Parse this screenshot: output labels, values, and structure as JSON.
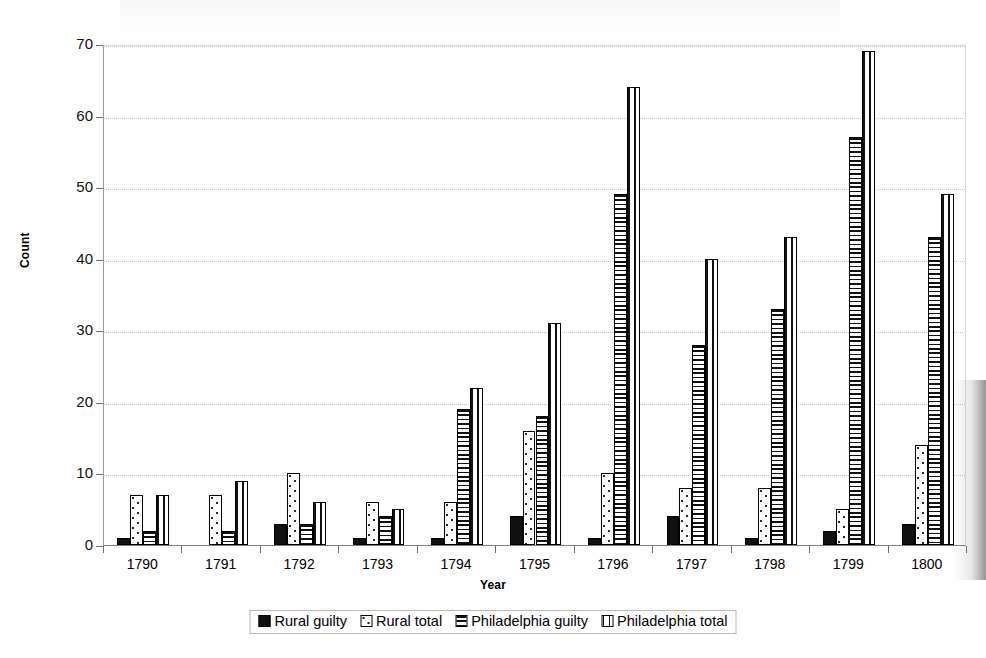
{
  "chart_data": {
    "type": "bar",
    "title": "",
    "xlabel": "Year",
    "ylabel": "Count",
    "ylim": [
      0,
      70
    ],
    "yticks": [
      0,
      10,
      20,
      30,
      40,
      50,
      60,
      70
    ],
    "grid": true,
    "legend_position": "bottom",
    "categories": [
      "1790",
      "1791",
      "1792",
      "1793",
      "1794",
      "1795",
      "1796",
      "1797",
      "1798",
      "1799",
      "1800"
    ],
    "series": [
      {
        "name": "Rural guilty",
        "pattern": "solid-black",
        "values": [
          1,
          0,
          3,
          1,
          1,
          4,
          1,
          4,
          1,
          2,
          3
        ]
      },
      {
        "name": "Rural total",
        "pattern": "dotted",
        "values": [
          7,
          7,
          10,
          6,
          6,
          16,
          10,
          8,
          8,
          5,
          14
        ]
      },
      {
        "name": "Philadelphia guilty",
        "pattern": "horizontal-lines",
        "values": [
          2,
          2,
          3,
          4,
          19,
          18,
          49,
          28,
          33,
          57,
          43
        ]
      },
      {
        "name": "Philadelphia total",
        "pattern": "vertical-lines",
        "values": [
          7,
          9,
          6,
          5,
          22,
          31,
          64,
          40,
          43,
          69,
          49
        ]
      }
    ]
  },
  "colors": {
    "bar_outline": "#000000",
    "series_fill": "#101010",
    "gridline": "#c9c9c9",
    "axis": "#6f6f6f",
    "background": "#ffffff"
  }
}
